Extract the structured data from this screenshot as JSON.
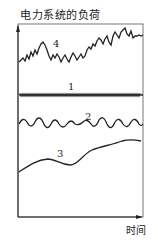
{
  "figure": {
    "title": "电力系统的负荷",
    "x_axis_label": "时间",
    "curves": [
      {
        "id": "4",
        "label": "4",
        "description": "rising load with large irregular fluctuations"
      },
      {
        "id": "1",
        "label": "1",
        "description": "small high-frequency random fluctuation"
      },
      {
        "id": "2",
        "label": "2",
        "description": "medium-period oscillation"
      },
      {
        "id": "3",
        "label": "3",
        "description": "slow long-term trend"
      }
    ],
    "colors": {
      "line": "#222222",
      "background": "#ffffff"
    }
  }
}
